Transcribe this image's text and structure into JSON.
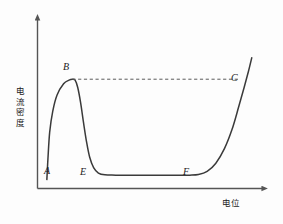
{
  "figure": {
    "background_color": "#fdfdfd",
    "line_color": "#3a3a3a",
    "axis_color": "#555555",
    "text_color": "#1a1a1a"
  },
  "axes": {
    "y_label": "电流密度",
    "y_label_chars": [
      "电",
      "流",
      "密",
      "度"
    ],
    "x_label": "电位"
  },
  "chart_data": {
    "type": "line",
    "title": "",
    "xlabel": "电位",
    "ylabel": "电流密度",
    "xlim": [
      0,
      100
    ],
    "ylim": [
      0,
      100
    ],
    "grid": false,
    "legend": false,
    "axis_arrows": true,
    "tick_labels_x": [],
    "tick_labels_y": [],
    "series": [
      {
        "name": "anodic-polarization-curve",
        "style": "solid",
        "color": "#3a3a3a",
        "points": [
          [
            4.3,
            6.0
          ],
          [
            4.8,
            20.0
          ],
          [
            5.6,
            38.0
          ],
          [
            7.0,
            52.0
          ],
          [
            9.0,
            63.0
          ],
          [
            12.0,
            70.5
          ],
          [
            14.5,
            73.0
          ],
          [
            16.0,
            73.6
          ],
          [
            17.3,
            73.0
          ],
          [
            18.5,
            68.0
          ],
          [
            19.8,
            58.0
          ],
          [
            21.2,
            44.0
          ],
          [
            22.6,
            31.0
          ],
          [
            24.0,
            21.0
          ],
          [
            25.8,
            14.0
          ],
          [
            28.0,
            10.4
          ],
          [
            31.0,
            9.2
          ],
          [
            36.0,
            9.0
          ],
          [
            50.0,
            9.0
          ],
          [
            64.0,
            9.0
          ],
          [
            70.0,
            9.0
          ],
          [
            74.0,
            9.4
          ],
          [
            78.0,
            11.5
          ],
          [
            82.0,
            17.0
          ],
          [
            86.0,
            27.0
          ],
          [
            89.5,
            40.0
          ],
          [
            92.5,
            55.0
          ],
          [
            95.0,
            68.0
          ],
          [
            97.0,
            79.0
          ],
          [
            98.5,
            88.0
          ]
        ]
      },
      {
        "name": "passive-current-reference-line",
        "style": "dashed",
        "color": "#5a5a5a",
        "points": [
          [
            16.0,
            73.6
          ],
          [
            93.0,
            73.6
          ]
        ]
      }
    ],
    "annotations": [
      {
        "label": "A",
        "x": 4.3,
        "y": 6.0,
        "desc": "curve start, active dissolution onset"
      },
      {
        "label": "B",
        "x": 16.0,
        "y": 73.6,
        "desc": "critical passivation current peak"
      },
      {
        "label": "C",
        "x": 93.0,
        "y": 73.6,
        "desc": "transpassive point on dashed reference level"
      },
      {
        "label": "E",
        "x": 31.0,
        "y": 9.0,
        "desc": "start of passive plateau"
      },
      {
        "label": "F",
        "x": 74.0,
        "y": 9.0,
        "desc": "end of passive plateau"
      }
    ]
  }
}
